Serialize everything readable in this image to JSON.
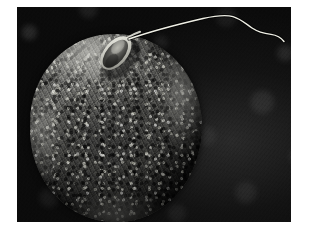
{
  "image": {
    "type": "scanning-electron-micrograph",
    "subject": "human sperm cell on the surface of an ovum (egg cell)",
    "caption_text": "",
    "palette": {
      "frame": "#ffffff",
      "background_dark": "#0d0d0d",
      "background_mottle": "#2a2a2a",
      "egg_highlight": "#8f8f8b",
      "egg_midtone": "#4b4b49",
      "egg_shadow": "#1b1b1a",
      "sperm_bright": "#e8e8e0",
      "sperm_head_fill": "#5a5a56"
    },
    "frame": {
      "left": 17,
      "top": 7,
      "width": 274,
      "height": 215
    },
    "objects": [
      {
        "name": "ovum",
        "label": "egg cell",
        "shape": "sphere",
        "center_x": 100,
        "center_y": 122,
        "radius_x": 86,
        "radius_y": 94,
        "surface": "granular zona pellucida with fibrous striations"
      },
      {
        "name": "sperm-head",
        "label": "sperm head",
        "shape": "teardrop-oval",
        "center_x": 100,
        "center_y": 45,
        "length": 34,
        "width": 17,
        "rotation_deg": 42
      },
      {
        "name": "sperm-tail",
        "label": "flagellum",
        "shape": "undulating-filament",
        "start_x": 113,
        "start_y": 33,
        "end_x": 268,
        "end_y": 36,
        "peak_y": 9
      }
    ]
  }
}
